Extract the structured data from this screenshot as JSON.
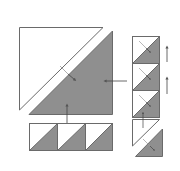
{
  "diagram": {
    "title": "",
    "type": "quilt-assembly",
    "colors": {
      "background": "#ffffff",
      "fabric_light": "#ffffff",
      "fabric_dark": "#8f8f8f",
      "outline": "#6a6a6a",
      "arrow": "#555555"
    },
    "pieces": {
      "large_light_triangle": "light half-square triangle",
      "large_dark_triangle": "dark half-square triangle",
      "bottom_row": "3 half-square triangle units",
      "right_column": "3 half-square triangle units + setting triangles"
    }
  }
}
